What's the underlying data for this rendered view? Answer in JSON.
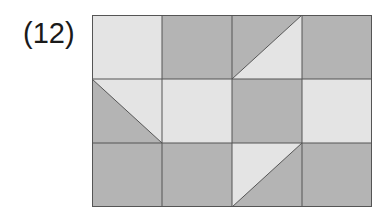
{
  "figure": {
    "label": "(12)",
    "colors": {
      "light": "#e4e4e4",
      "dark": "#b4b4b4",
      "line": "#555555"
    },
    "grid": {
      "rows": 3,
      "cols": 4,
      "cell_width": 70,
      "cell_height": 64,
      "cells": [
        [
          {
            "type": "solid",
            "fill": "light"
          },
          {
            "type": "solid",
            "fill": "dark"
          },
          {
            "type": "split",
            "diagonal": "bl-tr",
            "tl": "dark",
            "br": "light"
          },
          {
            "type": "solid",
            "fill": "dark"
          }
        ],
        [
          {
            "type": "split",
            "diagonal": "tl-br",
            "tr": "light",
            "bl": "dark"
          },
          {
            "type": "solid",
            "fill": "light"
          },
          {
            "type": "solid",
            "fill": "dark"
          },
          {
            "type": "solid",
            "fill": "light"
          }
        ],
        [
          {
            "type": "solid",
            "fill": "dark"
          },
          {
            "type": "solid",
            "fill": "dark"
          },
          {
            "type": "split",
            "diagonal": "tr-bl",
            "tl": "light",
            "br": "dark"
          },
          {
            "type": "solid",
            "fill": "dark"
          }
        ]
      ]
    }
  }
}
